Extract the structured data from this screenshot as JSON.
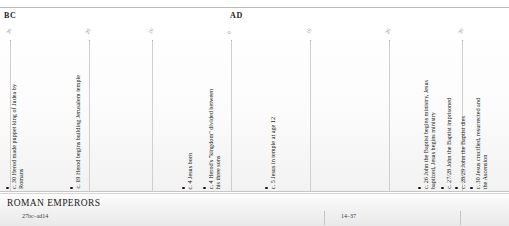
{
  "top_caption": "",
  "eras": {
    "bc": "BC",
    "ad": "AD"
  },
  "axis": {
    "ticks": [
      {
        "label": "30",
        "x": 10
      },
      {
        "label": "20",
        "x": 89
      },
      {
        "label": "10",
        "x": 152
      },
      {
        "label": "0",
        "x": 231
      },
      {
        "label": "10",
        "x": 310
      },
      {
        "label": "20",
        "x": 389
      },
      {
        "label": "30",
        "x": 462
      }
    ]
  },
  "events": [
    {
      "text": "c. 30 Herod made puppet king of Judea by\nRomans",
      "x": 6
    },
    {
      "text": "c. 19 Herod begins building Jerusalem temple",
      "x": 70
    },
    {
      "text": "c. 4 Jesus born",
      "x": 182
    },
    {
      "text": "c. 4 Herod's \"kingdom\" divided between\nhis three sons",
      "x": 203
    },
    {
      "text": "c. 5 Jesus in temple at age 12",
      "x": 265
    },
    {
      "text": "c. 26 John the Baptist begins ministry, Jesus\nbaptized, Jesus begins ministry",
      "x": 418
    },
    {
      "text": "c. 27/28 John the Baptist imprisoned",
      "x": 441
    },
    {
      "text": "c. 28/29 John the Baptist dies",
      "x": 455
    },
    {
      "text": "c. 30 Jesus crucified, resurrected and\nthe Ascension",
      "x": 470
    }
  ],
  "band": {
    "title": "ROMAN EMPERORS",
    "reigns": [
      {
        "label": "27bc–ad14",
        "x": 22
      },
      {
        "label": "14–37",
        "x": 341
      }
    ],
    "separators": [
      {
        "x": 324
      },
      {
        "x": 460
      }
    ]
  }
}
